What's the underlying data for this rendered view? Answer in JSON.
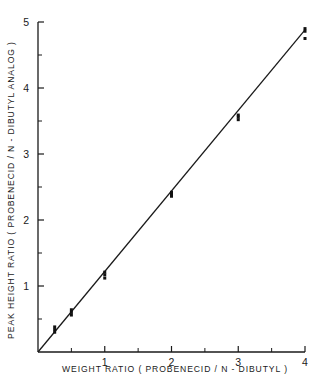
{
  "chart_data": {
    "type": "scatter",
    "title": "",
    "xlabel": "WEIGHT RATIO ( PROBENECID / N - DIBUTYL )",
    "ylabel": "PEAK HEIGHT RATIO ( PROBENECID / N - DIBUTYL  ANALOG )",
    "xlim": [
      0,
      4
    ],
    "ylim": [
      0,
      5
    ],
    "xticks": [
      1,
      2,
      3,
      4
    ],
    "yticks": [
      1,
      2,
      3,
      4,
      5
    ],
    "xticklabels": [
      "1",
      "2",
      "3",
      "4"
    ],
    "yticklabels": [
      "1",
      "2",
      "3",
      "4",
      "5"
    ],
    "xminor": [
      0.5,
      1.5,
      2.5,
      3.5
    ],
    "yminor": [
      0.5,
      1.5,
      2.5,
      3.5,
      4.5
    ],
    "grid": false,
    "legend": null,
    "series": [
      {
        "name": "calibration replicates",
        "marker": "filled-square",
        "points": [
          {
            "x": 0.25,
            "y": 0.34
          },
          {
            "x": 0.25,
            "y": 0.3
          },
          {
            "x": 0.25,
            "y": 0.38
          },
          {
            "x": 0.5,
            "y": 0.6
          },
          {
            "x": 0.5,
            "y": 0.56
          },
          {
            "x": 0.5,
            "y": 0.64
          },
          {
            "x": 1.0,
            "y": 1.17
          },
          {
            "x": 1.0,
            "y": 1.12
          },
          {
            "x": 1.0,
            "y": 1.21
          },
          {
            "x": 2.0,
            "y": 2.42
          },
          {
            "x": 2.0,
            "y": 2.36
          },
          {
            "x": 2.0,
            "y": 2.39
          },
          {
            "x": 3.0,
            "y": 3.59
          },
          {
            "x": 3.0,
            "y": 3.52
          },
          {
            "x": 3.0,
            "y": 3.56
          },
          {
            "x": 4.0,
            "y": 4.9
          },
          {
            "x": 4.0,
            "y": 4.86
          },
          {
            "x": 4.0,
            "y": 4.75
          }
        ]
      }
    ],
    "fit_line": {
      "name": "least-squares regression line",
      "x_start": 0.0,
      "y_start": 0.0,
      "x_end": 4.0,
      "y_end": 4.88
    }
  }
}
